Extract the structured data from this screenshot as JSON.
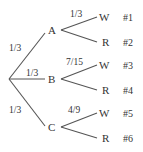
{
  "diagram": {
    "type": "probability-tree",
    "first_level": [
      {
        "node": "A",
        "probability": "1/3"
      },
      {
        "node": "B",
        "probability": "1/3"
      },
      {
        "node": "C",
        "probability": "1/3"
      }
    ],
    "second_level": [
      {
        "parent": "A",
        "probability": "1/3",
        "branches": [
          {
            "label": "W",
            "outcome": "#1"
          },
          {
            "label": "R",
            "outcome": "#2"
          }
        ]
      },
      {
        "parent": "B",
        "probability": "7/15",
        "branches": [
          {
            "label": "W",
            "outcome": "#3"
          },
          {
            "label": "R",
            "outcome": "#4"
          }
        ]
      },
      {
        "parent": "C",
        "probability": "4/9",
        "branches": [
          {
            "label": "W",
            "outcome": "#5"
          },
          {
            "label": "R",
            "outcome": "#6"
          }
        ]
      }
    ]
  }
}
